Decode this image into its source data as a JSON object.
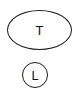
{
  "diagram": {
    "nodes": [
      {
        "id": "n1",
        "shape": "ellipse",
        "label": "T"
      },
      {
        "id": "n2",
        "shape": "circle",
        "label": "L"
      }
    ],
    "colors": {
      "stroke": "#1a1a1a",
      "text": "#111111",
      "background": "#ffffff"
    }
  }
}
